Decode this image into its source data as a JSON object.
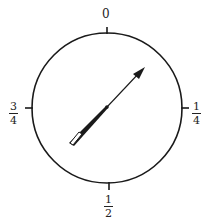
{
  "dial": {
    "center": [
      107,
      108
    ],
    "radius": 75,
    "stroke_color": "#1a1a1a",
    "tick_length": 7
  },
  "labels": {
    "top": {
      "text": "0"
    },
    "right": {
      "num": "1",
      "den": "4"
    },
    "bottom": {
      "num": "1",
      "den": "2"
    },
    "left": {
      "num": "3",
      "den": "4"
    }
  },
  "needle": {
    "pointing_to": "1/8",
    "tip": [
      144,
      68
    ],
    "tail": [
      70,
      145
    ],
    "color": "#1a1a1a"
  }
}
